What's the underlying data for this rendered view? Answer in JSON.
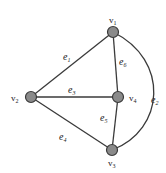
{
  "diagram": {
    "type": "graph",
    "vertices": [
      {
        "id": "v1",
        "name": "v",
        "sub": "1",
        "x": 113,
        "y": 32,
        "label_x": 109,
        "label_y": 23
      },
      {
        "id": "v2",
        "name": "v",
        "sub": "2",
        "x": 31,
        "y": 97,
        "label_x": 11,
        "label_y": 101
      },
      {
        "id": "v3",
        "name": "v",
        "sub": "3",
        "x": 112,
        "y": 150,
        "label_x": 108,
        "label_y": 166
      },
      {
        "id": "v4",
        "name": "v",
        "sub": "4",
        "x": 118,
        "y": 97,
        "label_x": 129,
        "label_y": 101
      }
    ],
    "edges": [
      {
        "id": "e1",
        "name": "e",
        "sub": "1",
        "from": "v1",
        "to": "v2",
        "label_x": 63,
        "label_y": 60
      },
      {
        "id": "e2",
        "name": "e",
        "sub": "2",
        "from": "v1",
        "to": "v3",
        "curved": true,
        "label_x": 151,
        "label_y": 103
      },
      {
        "id": "e3",
        "name": "e",
        "sub": "3",
        "from": "v2",
        "to": "v4",
        "label_x": 68,
        "label_y": 93
      },
      {
        "id": "e4",
        "name": "e",
        "sub": "4",
        "from": "v2",
        "to": "v3",
        "label_x": 59,
        "label_y": 140
      },
      {
        "id": "e5",
        "name": "e",
        "sub": "5",
        "from": "v4",
        "to": "v3",
        "label_x": 100,
        "label_y": 121
      },
      {
        "id": "e6",
        "name": "e",
        "sub": "6",
        "from": "v1",
        "to": "v4",
        "label_x": 119,
        "label_y": 65
      }
    ],
    "colors": {
      "node_fill": "#8a8a8a",
      "stroke": "#3a3a3a",
      "background": "#ffffff"
    }
  }
}
